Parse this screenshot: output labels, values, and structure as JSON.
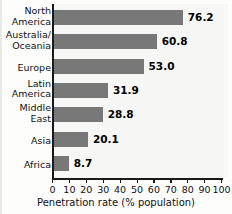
{
  "chart_data": {
    "type": "bar",
    "orientation": "horizontal",
    "title": "",
    "xlabel": "Penetration rate (% population)",
    "ylabel": "",
    "xlim": [
      0,
      100
    ],
    "xticks": [
      "0",
      "10",
      "20",
      "30",
      "40",
      "50",
      "60",
      "70",
      "80",
      "90",
      "100"
    ],
    "grid": false,
    "legend": null,
    "bar_color": "#787878",
    "plot_background": "#f7f7f5",
    "categories": [
      "North\nAmerica",
      "Australia/\nOceania",
      "Europe",
      "Latin\nAmerica",
      "Middle\nEast",
      "Asia",
      "Africa"
    ],
    "values": [
      76.2,
      60.8,
      53.0,
      31.9,
      28.8,
      20.1,
      8.7
    ],
    "value_labels": [
      "76.2",
      "60.8",
      "53.0",
      "31.9",
      "28.8",
      "20.1",
      "8.7"
    ]
  },
  "axis": {
    "x_title": "Penetration rate (% population)",
    "ticks": [
      {
        "label": "0",
        "value": 0
      },
      {
        "label": "10",
        "value": 10
      },
      {
        "label": "20",
        "value": 20
      },
      {
        "label": "30",
        "value": 30
      },
      {
        "label": "40",
        "value": 40
      },
      {
        "label": "50",
        "value": 50
      },
      {
        "label": "60",
        "value": 60
      },
      {
        "label": "70",
        "value": 70
      },
      {
        "label": "80",
        "value": 80
      },
      {
        "label": "90",
        "value": 90
      },
      {
        "label": "100",
        "value": 100
      }
    ]
  },
  "bars": [
    {
      "category": "North\nAmerica",
      "value": 76.2,
      "label": "76.2"
    },
    {
      "category": "Australia/\nOceania",
      "value": 60.8,
      "label": "60.8"
    },
    {
      "category": "Europe",
      "value": 53.0,
      "label": "53.0"
    },
    {
      "category": "Latin\nAmerica",
      "value": 31.9,
      "label": "31.9"
    },
    {
      "category": "Middle\nEast",
      "value": 28.8,
      "label": "28.8"
    },
    {
      "category": "Asia",
      "value": 20.1,
      "label": "20.1"
    },
    {
      "category": "Africa",
      "value": 8.7,
      "label": "8.7"
    }
  ]
}
